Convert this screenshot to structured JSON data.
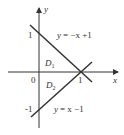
{
  "diagram": {
    "axes": {
      "x_label": "x",
      "y_label": "y",
      "origin_label": "0"
    },
    "ticks": {
      "y_pos": "1",
      "y_neg": "-1",
      "x_pos": "1"
    },
    "lines": [
      {
        "equation": "y = −x + 1",
        "y_prefix": "y",
        "rhs": "= −x +1"
      },
      {
        "equation": "y = x − 1",
        "y_prefix": "y",
        "rhs": "= x −1"
      }
    ],
    "regions": [
      {
        "label": "D",
        "sub": "1"
      },
      {
        "label": "D",
        "sub": "2"
      }
    ],
    "colors": {
      "stroke": "#333333",
      "background": "#ffffff"
    }
  }
}
